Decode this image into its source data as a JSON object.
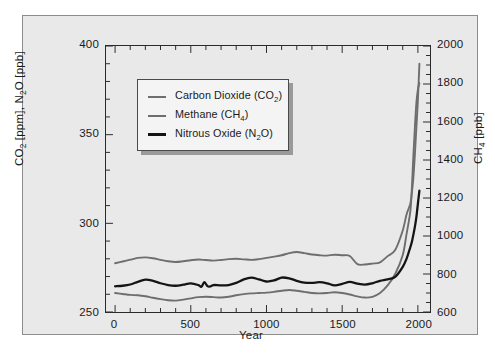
{
  "chart_data": {
    "type": "line",
    "title": "",
    "xlabel": "Year",
    "ylabel_left": "CO2 [ppm], N2O [ppb]",
    "ylabel_right": "CH4 [ppb]",
    "xlim": [
      -60,
      2080
    ],
    "ylim_left": [
      250,
      400
    ],
    "ylim_right": [
      600,
      2000
    ],
    "grid": false,
    "legend_position": "upper-left-inside",
    "x_ticks": [
      0,
      500,
      1000,
      1500,
      2000
    ],
    "x_tick_labels": [
      "0",
      "500",
      "1000",
      "1500",
      "2000"
    ],
    "y_ticks_left": [
      250,
      300,
      350,
      400
    ],
    "y_tick_labels_left": [
      "250",
      "300",
      "350",
      "400"
    ],
    "y_ticks_right": [
      600,
      800,
      1000,
      1200,
      1400,
      1600,
      1800,
      2000
    ],
    "y_tick_labels_right": [
      "600",
      "800",
      "1000",
      "1200",
      "1400",
      "1600",
      "1800",
      "2000"
    ],
    "y_minor_step_left": 10,
    "y_minor_step_right": 50,
    "x_minor_step": 100,
    "series": [
      {
        "name": "Carbon Dioxide (CO2)",
        "legend_label": "Carbon Dioxide (CO₂)",
        "axis": "left",
        "unit": "ppm",
        "color": "#6e6e6e",
        "width": 1.9,
        "x": [
          0,
          50,
          100,
          150,
          200,
          250,
          300,
          350,
          400,
          450,
          500,
          550,
          600,
          650,
          700,
          750,
          800,
          850,
          900,
          950,
          1000,
          1050,
          1100,
          1150,
          1200,
          1250,
          1300,
          1350,
          1400,
          1450,
          1500,
          1550,
          1600,
          1650,
          1700,
          1750,
          1800,
          1850,
          1900,
          1925,
          1950,
          1960,
          1970,
          1980,
          1990,
          2000,
          2010
        ],
        "y": [
          277.5,
          278.5,
          279.5,
          280.5,
          280.8,
          280.3,
          279.4,
          278.6,
          278.2,
          278.6,
          279.2,
          279.6,
          279.3,
          279.0,
          279.3,
          279.8,
          280.0,
          279.7,
          279.4,
          279.8,
          280.5,
          281.2,
          282.0,
          283.2,
          283.8,
          283.2,
          282.4,
          282.0,
          281.8,
          282.3,
          282.0,
          281.6,
          277.0,
          276.8,
          277.3,
          278.0,
          281.5,
          285.0,
          296.0,
          305.0,
          311.0,
          317.0,
          325.5,
          338.5,
          354.0,
          369.5,
          390.0
        ]
      },
      {
        "name": "Methane (CH4)",
        "legend_label": "Methane (CH₄)",
        "axis": "right",
        "unit": "ppb",
        "color": "#6e6e6e",
        "width": 1.9,
        "x": [
          0,
          50,
          100,
          150,
          200,
          250,
          300,
          350,
          400,
          450,
          500,
          550,
          600,
          650,
          700,
          750,
          800,
          850,
          900,
          950,
          1000,
          1050,
          1100,
          1150,
          1200,
          1250,
          1300,
          1350,
          1400,
          1450,
          1500,
          1550,
          1600,
          1650,
          1700,
          1750,
          1800,
          1850,
          1900,
          1925,
          1950,
          1960,
          1970,
          1980,
          1990,
          2000,
          2010
        ],
        "y": [
          700,
          695,
          690,
          688,
          683,
          675,
          668,
          662,
          660,
          665,
          672,
          678,
          680,
          678,
          676,
          680,
          688,
          694,
          698,
          700,
          702,
          706,
          712,
          716,
          712,
          706,
          700,
          698,
          700,
          704,
          700,
          692,
          682,
          676,
          680,
          700,
          740,
          800,
          900,
          1010,
          1130,
          1250,
          1420,
          1570,
          1700,
          1770,
          1805
        ]
      },
      {
        "name": "Nitrous Oxide (N2O)",
        "legend_label": "Nitrous Oxide (N₂O)",
        "axis": "left",
        "unit": "ppb",
        "color": "#141414",
        "width": 2.3,
        "x": [
          0,
          50,
          100,
          150,
          200,
          250,
          300,
          350,
          400,
          450,
          500,
          550,
          570,
          590,
          610,
          630,
          650,
          700,
          750,
          800,
          850,
          900,
          950,
          1000,
          1050,
          1100,
          1150,
          1200,
          1250,
          1300,
          1350,
          1400,
          1450,
          1500,
          1550,
          1600,
          1650,
          1700,
          1750,
          1800,
          1850,
          1900,
          1925,
          1950,
          1960,
          1970,
          1980,
          1990,
          2000,
          2010
        ],
        "y": [
          264.5,
          264.8,
          265.5,
          267.0,
          268.2,
          267.6,
          266.2,
          265.2,
          264.8,
          265.4,
          266.2,
          265.2,
          264.2,
          266.8,
          264.6,
          264.4,
          265.2,
          265.0,
          265.2,
          266.4,
          268.4,
          269.4,
          268.4,
          267.2,
          267.8,
          269.4,
          269.0,
          267.6,
          266.6,
          266.4,
          266.8,
          266.2,
          265.0,
          265.8,
          267.0,
          266.0,
          265.4,
          266.2,
          267.6,
          268.4,
          269.8,
          275.5,
          280.0,
          286.5,
          289.5,
          293.5,
          298.0,
          303.5,
          311.0,
          318.5
        ]
      }
    ]
  },
  "axes": {
    "x_title": "Year",
    "y_left_title_prefix": "CO",
    "y_left_title_sub1": "2",
    "y_left_title_mid": " [ppm], N",
    "y_left_title_sub2": "2",
    "y_left_title_suffix": "O [ppb]",
    "y_right_title_prefix": "CH",
    "y_right_title_sub": "4",
    "y_right_title_suffix": " [ppb]"
  },
  "legend": {
    "items": [
      {
        "label_prefix": "Carbon Dioxide (CO",
        "label_sub": "2",
        "label_suffix": ")",
        "color": "#6e6e6e"
      },
      {
        "label_prefix": "Methane (CH",
        "label_sub": "4",
        "label_suffix": ")",
        "color": "#6e6e6e"
      },
      {
        "label_prefix": "Nitrous Oxide (N",
        "label_sub": "2",
        "label_suffix": "O)",
        "color": "#141414"
      }
    ]
  }
}
